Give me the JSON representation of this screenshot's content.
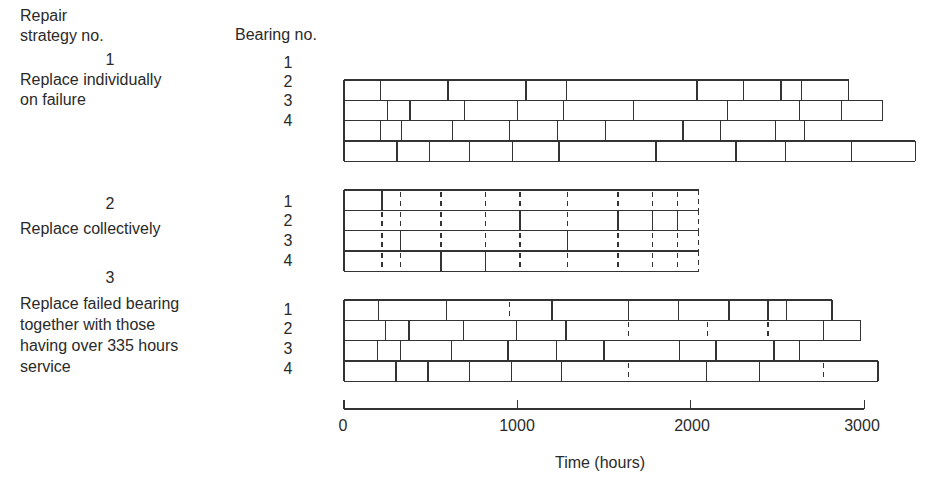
{
  "header": {
    "strategy_heading_line1": "Repair",
    "strategy_heading_line2": "strategy no.",
    "bearing_heading": "Bearing no."
  },
  "strategies": [
    {
      "number": "1",
      "label_lines": [
        "Replace individually",
        "on failure"
      ],
      "bearings": [
        "1",
        "2",
        "3",
        "4"
      ]
    },
    {
      "number": "2",
      "label_lines": [
        "Replace collectively"
      ],
      "bearings": [
        "1",
        "2",
        "3",
        "4"
      ]
    },
    {
      "number": "3",
      "label_lines": [
        "Replace failed bearing",
        "together with those",
        "having over 335 hours",
        "service"
      ],
      "bearings": [
        "1",
        "2",
        "3",
        "4"
      ]
    }
  ],
  "axis": {
    "title": "Time (hours)",
    "ticks": [
      "0",
      "1000",
      "2000",
      "3000"
    ],
    "tick_values": [
      0,
      1000,
      2000,
      3000
    ]
  },
  "chart_data": {
    "type": "timeline",
    "xlabel": "Time (hours)",
    "xlim": [
      0,
      3000
    ],
    "note": "Each row is a bearing; each box is one bearing life between replacements. Solid divider = failure/replacement, dashed divider = preventive replacement without failure.",
    "strategies": [
      {
        "name": "Replace individually on failure",
        "rows": [
          {
            "bearing": 1,
            "end": 2910,
            "solid": [
              210,
              600,
              1050,
              1285,
              2035,
              2305,
              2520,
              2640
            ],
            "dashed": []
          },
          {
            "bearing": 2,
            "end": 3105,
            "solid": [
              250,
              380,
              695,
              1000,
              1265,
              1670,
              2210,
              2625,
              2870
            ],
            "dashed": []
          },
          {
            "bearing": 3,
            "end": 2655,
            "solid": [
              210,
              330,
              625,
              955,
              1230,
              1510,
              1955,
              2170,
              2490
            ],
            "dashed": []
          },
          {
            "bearing": 4,
            "end": 3295,
            "solid": [
              305,
              495,
              725,
              970,
              1240,
              1800,
              2260,
              2545,
              2925
            ],
            "dashed": []
          }
        ]
      },
      {
        "name": "Replace collectively",
        "rows": [
          {
            "bearing": 1,
            "end": 2045,
            "solid": [
              220
            ],
            "dashed": [
              325,
              560,
              815,
              1015,
              1290,
              1580,
              1780,
              1925
            ]
          },
          {
            "bearing": 2,
            "end": 2045,
            "solid": [
              1015,
              1580,
              1780,
              1925
            ],
            "dashed": [
              220,
              325,
              560,
              815,
              1290
            ]
          },
          {
            "bearing": 3,
            "end": 2045,
            "solid": [
              325,
              1290
            ],
            "dashed": [
              220,
              560,
              815,
              1015,
              1580,
              1780,
              1925
            ]
          },
          {
            "bearing": 4,
            "end": 2045,
            "solid": [
              560,
              815
            ],
            "dashed": [
              220,
              325,
              1015,
              1290,
              1580,
              1780,
              1925
            ]
          }
        ]
      },
      {
        "name": "Replace failed bearing together with those having over 335 hours service",
        "rows": [
          {
            "bearing": 1,
            "end": 2815,
            "solid": [
              200,
              590,
              1200,
              1640,
              1930,
              2220,
              2445,
              2550
            ],
            "dashed": [
              955
            ]
          },
          {
            "bearing": 2,
            "end": 2980,
            "solid": [
              240,
              375,
              690,
              995,
              1280,
              2765
            ],
            "dashed": [
              1640,
              2095,
              2445
            ]
          },
          {
            "bearing": 3,
            "end": 2625,
            "solid": [
              195,
              325,
              620,
              945,
              1225,
              1500,
              1935,
              2145,
              2480
            ],
            "dashed": []
          },
          {
            "bearing": 4,
            "end": 3080,
            "solid": [
              300,
              485,
              725,
              965,
              1255,
              2090,
              2395
            ],
            "dashed": [
              1640,
              2765
            ]
          }
        ]
      }
    ]
  }
}
